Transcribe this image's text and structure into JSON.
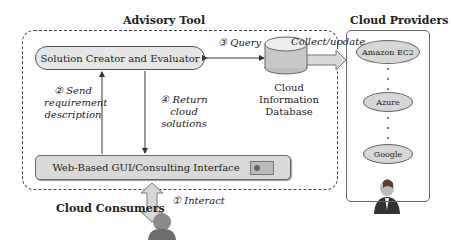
{
  "titles": {
    "advisory_tool": "Advisory Tool",
    "cloud_providers": "Cloud Providers",
    "cloud_consumers": "Cloud Consumers"
  },
  "components": {
    "solution_creator": "Solution Creator and Evaluator",
    "gui": "Web-Based GUI/Consulting Interface",
    "database_line1": "Cloud Information",
    "database_line2": "Database"
  },
  "steps": {
    "step1": "① Interact",
    "step2_line1": "② Send",
    "step2_line2": "requirement",
    "step2_line3": "description",
    "step3": "③ Query",
    "step4_line1": "④ Return cloud",
    "step4_line2": "solutions",
    "collect_update": "Collect/update"
  },
  "providers": [
    {
      "name": "Amazon EC2"
    },
    {
      "name": "Azure"
    },
    {
      "name": "Google"
    }
  ],
  "icons": {
    "consumer": "user-icon",
    "provider_admin": "businessman-icon",
    "database": "database-icon",
    "gui": "window-icon"
  }
}
